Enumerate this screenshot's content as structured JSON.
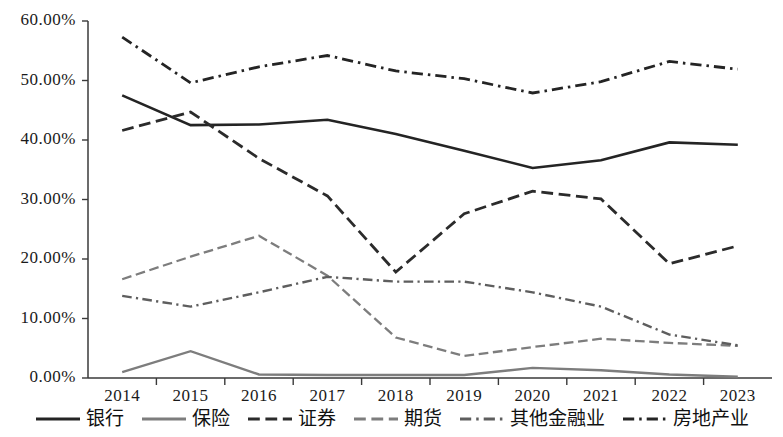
{
  "chart_data": {
    "type": "line",
    "title": "",
    "subtitle": "",
    "xlabel": "",
    "ylabel": "",
    "grid": false,
    "legend_position": "bottom",
    "x": [
      "2014",
      "2015",
      "2016",
      "2017",
      "2018",
      "2019",
      "2020",
      "2021",
      "2022",
      "2023"
    ],
    "categories": [
      "2014",
      "2015",
      "2016",
      "2017",
      "2018",
      "2019",
      "2020",
      "2021",
      "2022",
      "2023"
    ],
    "ylim": [
      0,
      60
    ],
    "yticks": [
      0,
      10,
      20,
      30,
      40,
      50,
      60
    ],
    "ytick_labels": [
      "0.00%",
      "10.00%",
      "20.00%",
      "30.00%",
      "40.00%",
      "50.00%",
      "60.00%"
    ],
    "series": [
      {
        "name": "银行",
        "style": "solid",
        "color": "#242424",
        "width": 2.6,
        "values": [
          47.5,
          42.5,
          42.6,
          43.4,
          41.0,
          38.2,
          35.3,
          36.6,
          39.6,
          39.2
        ]
      },
      {
        "name": "保险",
        "style": "solid",
        "color": "#7d7d7d",
        "width": 2.4,
        "values": [
          1.0,
          4.5,
          0.6,
          0.5,
          0.5,
          0.5,
          1.7,
          1.3,
          0.6,
          0.2
        ]
      },
      {
        "name": "证券",
        "style": "dashed",
        "color": "#2b2b2b",
        "width": 2.8,
        "values": [
          41.6,
          44.7,
          36.9,
          30.6,
          17.8,
          27.6,
          31.4,
          30.1,
          19.2,
          22.2
        ]
      },
      {
        "name": "期货",
        "style": "dashed",
        "color": "#7d7d7d",
        "width": 2.3,
        "values": [
          16.6,
          20.4,
          23.9,
          17.2,
          6.8,
          3.7,
          5.2,
          6.6,
          5.9,
          5.4
        ]
      },
      {
        "name": "其他金融业",
        "style": "dashdot",
        "color": "#5e5e5e",
        "width": 2.4,
        "values": [
          13.8,
          12.0,
          14.4,
          17.0,
          16.2,
          16.2,
          14.4,
          12.0,
          7.3,
          5.5
        ]
      },
      {
        "name": "房地产业",
        "style": "dashdot",
        "color": "#242424",
        "width": 2.8,
        "values": [
          57.3,
          49.6,
          52.3,
          54.2,
          51.6,
          50.3,
          47.9,
          49.8,
          53.2,
          51.9
        ]
      }
    ]
  },
  "legend": {
    "items": [
      {
        "label": "银行"
      },
      {
        "label": "保险"
      },
      {
        "label": "证券"
      },
      {
        "label": "期货"
      },
      {
        "label": "其他金融业"
      },
      {
        "label": "房地产业"
      }
    ]
  }
}
